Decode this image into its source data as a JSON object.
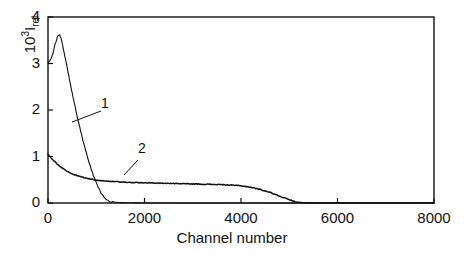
{
  "chart_data": {
    "type": "line",
    "title": "",
    "xlabel": "Channel number",
    "ylabel_text": "10",
    "ylabel_exponent": "3",
    "ylabel_symbol": "I",
    "ylabel_subscript": "rel",
    "xlim": [
      0,
      8000
    ],
    "ylim": [
      0,
      4
    ],
    "xticks": [
      0,
      2000,
      4000,
      6000,
      8000
    ],
    "xtick_labels": [
      "0",
      "2000",
      "4000",
      "6000",
      "8000"
    ],
    "yticks": [
      0,
      1,
      2,
      3,
      4
    ],
    "ytick_labels": [
      "0",
      "1",
      "2",
      "3",
      "4"
    ],
    "grid": false,
    "legend_position": "inline-annotations",
    "line_color": "#111111",
    "frame_color": "#111111",
    "background": "#ffffff",
    "annotations": [
      {
        "label": "1",
        "x_px": 101,
        "y_px": 103,
        "leader_from_x": 101,
        "leader_from_y": 111,
        "leader_to_x": 72,
        "leader_to_y": 122
      },
      {
        "label": "2",
        "x_px": 138,
        "y_px": 148,
        "leader_from_x": 138,
        "leader_from_y": 160,
        "leader_to_x": 124,
        "leader_to_y": 175
      }
    ],
    "series": [
      {
        "name": "1",
        "comment": "sharp peak near channel 250, decays to zero by channel ~1200",
        "x": [
          0,
          50,
          100,
          150,
          200,
          240,
          270,
          300,
          330,
          360,
          400,
          450,
          500,
          560,
          620,
          680,
          740,
          800,
          860,
          920,
          980,
          1040,
          1100,
          1160,
          1220,
          1300,
          1450,
          1700,
          2000,
          3000,
          4000,
          5000,
          6000,
          7000,
          8000
        ],
        "y": [
          3.02,
          3.08,
          3.2,
          3.42,
          3.58,
          3.63,
          3.55,
          3.4,
          3.25,
          3.1,
          2.9,
          2.63,
          2.38,
          2.08,
          1.8,
          1.53,
          1.28,
          1.05,
          0.84,
          0.65,
          0.48,
          0.34,
          0.22,
          0.13,
          0.07,
          0.03,
          0.01,
          0.005,
          0.0,
          0.0,
          0.0,
          0.0,
          0.0,
          0.0,
          0.0
        ]
      },
      {
        "name": "2",
        "comment": "broad low plateau starting ~1.05, slow decay to zero near channel 5200",
        "x": [
          0,
          100,
          200,
          300,
          400,
          500,
          600,
          700,
          800,
          900,
          1000,
          1200,
          1400,
          1600,
          1800,
          2000,
          2200,
          2400,
          2600,
          2800,
          3000,
          3200,
          3400,
          3600,
          3800,
          4000,
          4200,
          4400,
          4600,
          4800,
          5000,
          5150,
          5300,
          5600,
          6000,
          6500,
          7000,
          7500,
          8000
        ],
        "y": [
          1.05,
          0.93,
          0.83,
          0.75,
          0.68,
          0.63,
          0.59,
          0.56,
          0.53,
          0.51,
          0.49,
          0.47,
          0.455,
          0.445,
          0.44,
          0.435,
          0.43,
          0.425,
          0.42,
          0.415,
          0.41,
          0.405,
          0.4,
          0.395,
          0.385,
          0.37,
          0.34,
          0.29,
          0.23,
          0.15,
          0.07,
          0.02,
          0.005,
          0.0,
          0.0,
          0.0,
          0.0,
          0.0,
          0.0
        ]
      }
    ]
  },
  "axes_pixels": {
    "left": 48,
    "right": 434,
    "top": 17,
    "bottom": 203
  }
}
